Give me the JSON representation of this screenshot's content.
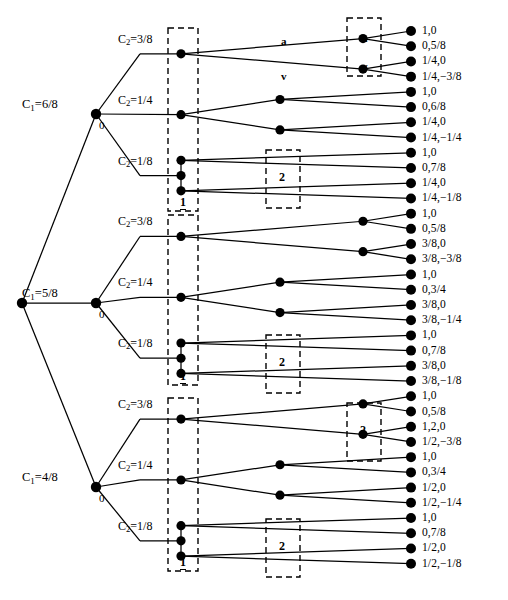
{
  "figure": {
    "domain_type": "extensive-form-game-tree",
    "caption": "",
    "width": 508,
    "height": 600,
    "colors": {
      "ink": "#000000",
      "background": "#ffffff"
    }
  },
  "tree": {
    "root": {
      "name": "root-node",
      "x": 22,
      "y": 303
    },
    "level1": [
      {
        "id": "c1-6-8",
        "label": "C",
        "sub": "1",
        "value": "6/8",
        "text": "C₁=6/8",
        "x": 96,
        "y": 114,
        "zero_label": "0"
      },
      {
        "id": "c1-5-8",
        "label": "C",
        "sub": "1",
        "value": "5/8",
        "text": "C₁=5/8",
        "x": 96,
        "y": 303,
        "zero_label": "0"
      },
      {
        "id": "c1-4-8",
        "label": "C",
        "sub": "1",
        "value": "4/8",
        "text": "C₁=4/8",
        "x": 96,
        "y": 487,
        "zero_label": "0"
      }
    ],
    "level2_labels": [
      {
        "text": "C₂=3/8",
        "value": "3/8"
      },
      {
        "text": "C₂=1/4",
        "value": "1/4"
      },
      {
        "text": "C₂=1/8",
        "value": "1/8"
      }
    ],
    "branch_labels": [
      {
        "name": "edge-label-a",
        "text": "a",
        "x": 281,
        "y": 36
      },
      {
        "name": "edge-label-v",
        "text": "v",
        "x": 281,
        "y": 71
      },
      {
        "name": "node-label-a",
        "text": "a",
        "x": 362,
        "y": 33
      },
      {
        "name": "node-label-v",
        "text": "v",
        "x": 362,
        "y": 61
      }
    ],
    "information_sets": [
      {
        "name": "iset-1-top",
        "label": "1",
        "x": 168,
        "y": 28,
        "w": 30,
        "h": 183
      },
      {
        "name": "iset-1-mid",
        "label": "1",
        "x": 168,
        "y": 215,
        "w": 30,
        "h": 170
      },
      {
        "name": "iset-1-bottom",
        "label": "1",
        "x": 168,
        "y": 398,
        "w": 30,
        "h": 173
      },
      {
        "name": "iset-2-top",
        "label": "2",
        "x": 266,
        "y": 150,
        "w": 34,
        "h": 58
      },
      {
        "name": "iset-2-mid",
        "label": "2",
        "x": 266,
        "y": 335,
        "w": 34,
        "h": 58
      },
      {
        "name": "iset-2-low",
        "label": "2",
        "x": 266,
        "y": 519,
        "w": 34,
        "h": 58
      },
      {
        "name": "iset-2-right-top",
        "label": "a/v",
        "x": 347,
        "y": 18,
        "w": 34,
        "h": 58
      },
      {
        "name": "iset-2-right-bot",
        "label": "2",
        "x": 347,
        "y": 403,
        "w": 34,
        "h": 58
      }
    ],
    "decision_node_columns_x": [
      181,
      280,
      363
    ]
  },
  "chart_data": {
    "type": "tree",
    "title": "",
    "leaf_count": 36,
    "leaves": [
      {
        "i": 0,
        "text": "1,0",
        "p1": "1",
        "p2": "0"
      },
      {
        "i": 1,
        "text": "0,5/8",
        "p1": "0",
        "p2": "5/8"
      },
      {
        "i": 2,
        "text": "1/4,0",
        "p1": "1/4",
        "p2": "0"
      },
      {
        "i": 3,
        "text": "1/4,−3/8",
        "p1": "1/4",
        "p2": "−3/8"
      },
      {
        "i": 4,
        "text": "1,0",
        "p1": "1",
        "p2": "0"
      },
      {
        "i": 5,
        "text": "0,6/8",
        "p1": "0",
        "p2": "6/8"
      },
      {
        "i": 6,
        "text": "1/4,0",
        "p1": "1/4",
        "p2": "0"
      },
      {
        "i": 7,
        "text": "1/4,−1/4",
        "p1": "1/4",
        "p2": "−1/4"
      },
      {
        "i": 8,
        "text": "1,0",
        "p1": "1",
        "p2": "0"
      },
      {
        "i": 9,
        "text": "0,7/8",
        "p1": "0",
        "p2": "7/8"
      },
      {
        "i": 10,
        "text": "1/4,0",
        "p1": "1/4",
        "p2": "0"
      },
      {
        "i": 11,
        "text": "1/4,−1/8",
        "p1": "1/4",
        "p2": "−1/8"
      },
      {
        "i": 12,
        "text": "1,0",
        "p1": "1",
        "p2": "0"
      },
      {
        "i": 13,
        "text": "0,5/8",
        "p1": "0",
        "p2": "5/8"
      },
      {
        "i": 14,
        "text": "3/8,0",
        "p1": "3/8",
        "p2": "0"
      },
      {
        "i": 15,
        "text": "3/8,−3/8",
        "p1": "3/8",
        "p2": "−3/8"
      },
      {
        "i": 16,
        "text": "1,0",
        "p1": "1",
        "p2": "0"
      },
      {
        "i": 17,
        "text": "0,3/4",
        "p1": "0",
        "p2": "3/4"
      },
      {
        "i": 18,
        "text": "3/8,0",
        "p1": "3/8",
        "p2": "0"
      },
      {
        "i": 19,
        "text": "3/8,−1/4",
        "p1": "3/8",
        "p2": "−1/4"
      },
      {
        "i": 20,
        "text": "1,0",
        "p1": "1",
        "p2": "0"
      },
      {
        "i": 21,
        "text": "0,7/8",
        "p1": "0",
        "p2": "7/8"
      },
      {
        "i": 22,
        "text": "3/8,0",
        "p1": "3/8",
        "p2": "0"
      },
      {
        "i": 23,
        "text": "3/8,−1/8",
        "p1": "3/8",
        "p2": "−1/8"
      },
      {
        "i": 24,
        "text": "1,0",
        "p1": "1",
        "p2": "0"
      },
      {
        "i": 25,
        "text": "0,5/8",
        "p1": "0",
        "p2": "5/8"
      },
      {
        "i": 26,
        "text": "1,2,0",
        "p1": "1/2",
        "p2": "0"
      },
      {
        "i": 27,
        "text": "1/2,−3/8",
        "p1": "1/2",
        "p2": "−3/8"
      },
      {
        "i": 28,
        "text": "1,0",
        "p1": "1",
        "p2": "0"
      },
      {
        "i": 29,
        "text": "0,3/4",
        "p1": "0",
        "p2": "3/4"
      },
      {
        "i": 30,
        "text": "1/2,0",
        "p1": "1/2",
        "p2": "0"
      },
      {
        "i": 31,
        "text": "1/2,−1/4",
        "p1": "1/2",
        "p2": "−1/4"
      },
      {
        "i": 32,
        "text": "1,0",
        "p1": "1",
        "p2": "0"
      },
      {
        "i": 33,
        "text": "0,7/8",
        "p1": "0",
        "p2": "7/8"
      },
      {
        "i": 34,
        "text": "1/2,0",
        "p1": "1/2",
        "p2": "0"
      },
      {
        "i": 35,
        "text": "1/2,−1/8",
        "p1": "1/2",
        "p2": "−1/8"
      }
    ],
    "structure_note": "3 chance branches C1 x 3 chance branches C2 x 2 player-1 actions x 2 player-2 actions = 36 terminal nodes"
  }
}
